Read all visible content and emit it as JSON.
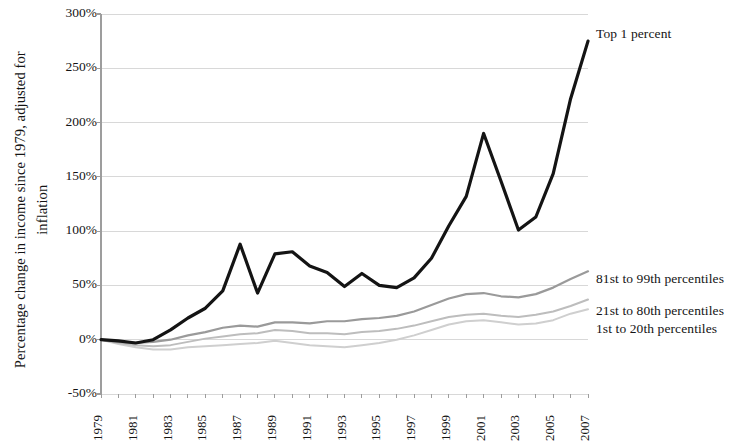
{
  "chart_data": {
    "type": "line",
    "title": "",
    "xlabel": "",
    "ylabel": "Percentage change in income since 1979, adjusted for inflation",
    "x": [
      1979,
      1980,
      1981,
      1982,
      1983,
      1984,
      1985,
      1986,
      1987,
      1988,
      1989,
      1990,
      1991,
      1992,
      1993,
      1994,
      1995,
      1996,
      1997,
      1998,
      1999,
      2000,
      2001,
      2002,
      2003,
      2004,
      2005,
      2006,
      2007
    ],
    "xlim": [
      1979,
      2007
    ],
    "ylim": [
      -50,
      300
    ],
    "ytick_labels": [
      "300%",
      "250%",
      "200%",
      "150%",
      "100%",
      "50%",
      "0%",
      "-50%"
    ],
    "ytick_values": [
      300,
      250,
      200,
      150,
      100,
      50,
      0,
      -50
    ],
    "xtick_labels": [
      "1979",
      "1981",
      "1983",
      "1985",
      "1987",
      "1989",
      "1991",
      "1993",
      "1995",
      "1997",
      "1999",
      "2001",
      "2003",
      "2005",
      "2007"
    ],
    "xtick_values": [
      1979,
      1981,
      1983,
      1985,
      1987,
      1989,
      1991,
      1993,
      1995,
      1997,
      1999,
      2001,
      2003,
      2005,
      2007
    ],
    "grid": "horizontal",
    "legend_position": "inline-right",
    "series": [
      {
        "name": "Top 1 percent",
        "color": "#141414",
        "width": 3.2,
        "label_x": 596,
        "label_y": 26,
        "values": [
          0,
          -1,
          -3,
          0,
          9,
          20,
          29,
          45,
          88,
          43,
          79,
          81,
          68,
          62,
          49,
          61,
          50,
          48,
          57,
          75,
          105,
          132,
          190,
          146,
          101,
          113,
          153,
          222,
          275
        ]
      },
      {
        "name": "81st to 99th percentiles",
        "color": "#9a9a9a",
        "width": 2.2,
        "label_x": 596,
        "label_y": 271,
        "values": [
          0,
          -2,
          -3,
          -2,
          0,
          4,
          7,
          11,
          13,
          12,
          16,
          16,
          15,
          17,
          17,
          19,
          20,
          22,
          26,
          32,
          38,
          42,
          43,
          40,
          39,
          42,
          48,
          56,
          63
        ]
      },
      {
        "name": "21st to 80th percentiles",
        "color": "#bdbdbd",
        "width": 2.0,
        "label_x": 596,
        "label_y": 303,
        "values": [
          0,
          -3,
          -5,
          -6,
          -5,
          -2,
          1,
          3,
          5,
          6,
          9,
          8,
          6,
          6,
          5,
          7,
          8,
          10,
          13,
          17,
          21,
          23,
          24,
          22,
          21,
          23,
          26,
          31,
          37
        ]
      },
      {
        "name": "1st to 20th percentiles",
        "color": "#cfcfcf",
        "width": 2.0,
        "label_x": 596,
        "label_y": 321,
        "values": [
          0,
          -4,
          -7,
          -9,
          -9,
          -7,
          -6,
          -5,
          -4,
          -3,
          -1,
          -3,
          -5,
          -6,
          -7,
          -5,
          -3,
          0,
          4,
          9,
          14,
          17,
          18,
          16,
          14,
          15,
          18,
          24,
          28
        ]
      }
    ],
    "plot_box": {
      "left": 101,
      "top": 14,
      "right": 588,
      "bottom": 394
    },
    "grid_color": "#d8d8d8",
    "axis_color": "#9d9d9d",
    "background": "#ffffff"
  }
}
